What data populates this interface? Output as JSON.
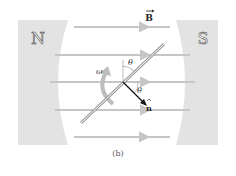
{
  "figure": {
    "caption": "(b)",
    "poles": {
      "north": "N",
      "south": "S"
    },
    "labels": {
      "field": "B",
      "normal": "n",
      "angle_top": "θ",
      "angle_bottom": "θ",
      "angular_velocity": "ω"
    },
    "colors": {
      "pole": "#e3e3e3",
      "pole_text": "#555555",
      "field_line": "#c6c6c6",
      "rod": "#9a9a9a",
      "rotation_arrow": "#bdbdbd",
      "normal_vector": "#111111"
    },
    "field_lines_count": 5
  }
}
